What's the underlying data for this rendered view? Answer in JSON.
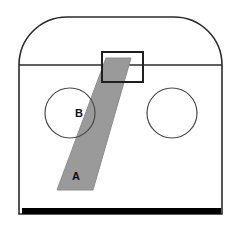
{
  "figure": {
    "background_color": "#ffffff",
    "outline_color": "#2b2b2b",
    "band_color": "#9a9a9a",
    "band_edge_color": "#8c8c8c",
    "floor_color": "#000000",
    "label_color": "#111111"
  },
  "labels": {
    "band_lower": "A",
    "band_upper": "B"
  },
  "shell": {
    "name": "container-outline",
    "left_x": 19,
    "right_x": 222,
    "bottom_y": 214,
    "shoulder_y": 65,
    "crown_y": 17,
    "corner_radius": 48
  },
  "divider": {
    "name": "horizontal-divider-line",
    "y": 65,
    "x_start": 19,
    "x_end": 222
  },
  "circles": [
    {
      "name": "left-circle",
      "cx": 70,
      "cy": 113,
      "r": 25
    },
    {
      "name": "right-circle",
      "cx": 172,
      "cy": 113,
      "r": 25
    }
  ],
  "top_rectangle": {
    "name": "top-port-rectangle",
    "x": 102,
    "y": 52,
    "width": 41,
    "height": 30
  },
  "band": {
    "name": "diagonal-band",
    "top_left_x": 106,
    "top_right_x": 131,
    "top_y": 58,
    "bottom_left_x": 57,
    "bottom_right_x": 93,
    "bottom_y": 190
  },
  "floor_bar": {
    "name": "floor-bar",
    "x": 22,
    "y": 208,
    "width": 199,
    "height": 6
  },
  "label_positions": {
    "band_lower": {
      "x": 76,
      "y": 180
    },
    "band_upper": {
      "x": 79,
      "y": 117
    }
  }
}
